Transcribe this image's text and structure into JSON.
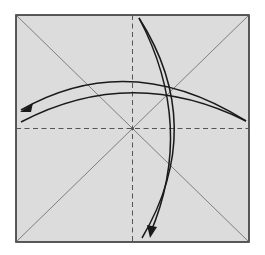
{
  "diagram": {
    "type": "origami-fold-diagram",
    "paper": {
      "x": 16,
      "y": 15,
      "width": 233,
      "height": 227,
      "fill": "#dcdcdc",
      "border": "#333333"
    },
    "crease_lines": {
      "diagonals": "valley-creases (thin solid)",
      "midlines": "dashed valley folds",
      "color": "#555555"
    },
    "arrows": [
      {
        "name": "horizontal-curved-arrow",
        "direction": "right-to-left",
        "description": "fold from right edge over to left"
      },
      {
        "name": "vertical-curved-arrow",
        "direction": "top-to-bottom",
        "description": "fold from top down to bottom"
      }
    ],
    "arrow_color": "#1a1a1a"
  }
}
